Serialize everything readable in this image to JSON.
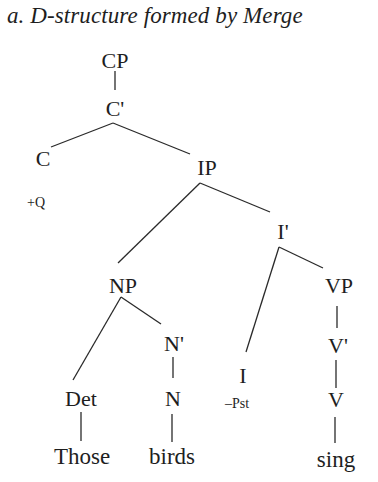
{
  "title": "a. D-structure formed by Merge",
  "tree": {
    "nodes": {
      "CP": "CP",
      "Cbar": "C'",
      "C": "C",
      "C_feature": "+Q",
      "IP": "IP",
      "Ibar": "I'",
      "NP": "NP",
      "Nbar": "N'",
      "Det": "Det",
      "N": "N",
      "I": "I",
      "I_feature": "–Pst",
      "VP": "VP",
      "Vbar": "V'",
      "V": "V"
    },
    "words": {
      "those": "Those",
      "birds": "birds",
      "sing": "sing"
    },
    "edges": [
      [
        "CP",
        "C'"
      ],
      [
        "C'",
        "C"
      ],
      [
        "C'",
        "IP"
      ],
      [
        "IP",
        "NP"
      ],
      [
        "IP",
        "I'"
      ],
      [
        "NP",
        "Det"
      ],
      [
        "NP",
        "N'"
      ],
      [
        "N'",
        "N"
      ],
      [
        "I'",
        "I"
      ],
      [
        "I'",
        "VP"
      ],
      [
        "VP",
        "V'"
      ],
      [
        "V'",
        "V"
      ],
      [
        "Det",
        "Those"
      ],
      [
        "N",
        "birds"
      ],
      [
        "V",
        "sing"
      ]
    ]
  }
}
